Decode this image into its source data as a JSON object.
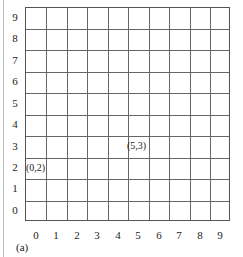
{
  "diagram": {
    "type": "coordinate-grid",
    "columns": 10,
    "rows": 10,
    "x_ticks": [
      "0",
      "1",
      "2",
      "3",
      "4",
      "5",
      "6",
      "7",
      "8",
      "9"
    ],
    "y_ticks": [
      "9",
      "8",
      "7",
      "6",
      "5",
      "4",
      "3",
      "2",
      "1",
      "0"
    ],
    "points": [
      {
        "label": "(0,2)",
        "x": 0,
        "y": 2
      },
      {
        "label": "(5,3)",
        "x": 5,
        "y": 3
      }
    ],
    "caption": "(a)"
  }
}
